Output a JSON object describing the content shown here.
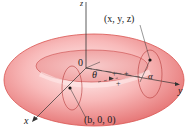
{
  "figure": {
    "type": "torus-diagram",
    "labels": {
      "z_axis": "z",
      "y_axis": "y",
      "x_axis": "x",
      "origin": "0",
      "point": "(x, y, z)",
      "center_point": "(b, 0, 0)",
      "theta": "θ",
      "alpha": "α"
    },
    "colors": {
      "torus_fill": "#f4a3a3",
      "torus_edge": "#d9534f",
      "torus_highlight": "#fde4e4",
      "axis": "#333333"
    }
  }
}
